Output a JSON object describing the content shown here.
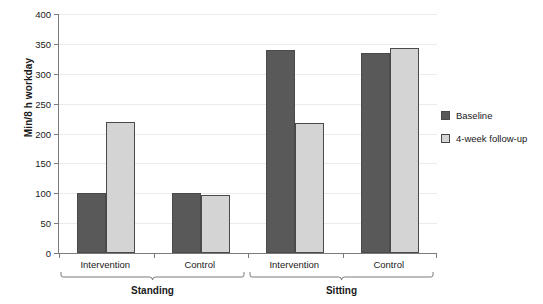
{
  "chart_data": {
    "type": "bar",
    "title": "",
    "xlabel": "",
    "ylabel": "Min/8 h workday",
    "ylim": [
      0,
      400
    ],
    "ytick_step": 50,
    "yticks": [
      400,
      350,
      300,
      250,
      200,
      150,
      100,
      50,
      0
    ],
    "grid": true,
    "legend_position": "right",
    "categories": [
      "Intervention",
      "Control",
      "Intervention",
      "Control"
    ],
    "supergroups": [
      {
        "label": "Standing",
        "categories": [
          "Intervention",
          "Control"
        ]
      },
      {
        "label": "Sitting",
        "categories": [
          "Intervention",
          "Control"
        ]
      }
    ],
    "series": [
      {
        "name": "Baseline",
        "color": "#595959",
        "values": [
          100,
          100,
          340,
          335
        ]
      },
      {
        "name": "4-week follow-up",
        "color": "#d4d4d4",
        "values": [
          220,
          97,
          218,
          343
        ]
      }
    ],
    "points": [
      {
        "supergroup": "Standing",
        "category": "Intervention",
        "series": "Baseline",
        "value": 100
      },
      {
        "supergroup": "Standing",
        "category": "Intervention",
        "series": "4-week follow-up",
        "value": 220
      },
      {
        "supergroup": "Standing",
        "category": "Control",
        "series": "Baseline",
        "value": 100
      },
      {
        "supergroup": "Standing",
        "category": "Control",
        "series": "4-week follow-up",
        "value": 97
      },
      {
        "supergroup": "Sitting",
        "category": "Intervention",
        "series": "Baseline",
        "value": 340
      },
      {
        "supergroup": "Sitting",
        "category": "Intervention",
        "series": "4-week follow-up",
        "value": 218
      },
      {
        "supergroup": "Sitting",
        "category": "Control",
        "series": "Baseline",
        "value": 335
      },
      {
        "supergroup": "Sitting",
        "category": "Control",
        "series": "4-week follow-up",
        "value": 343
      }
    ]
  },
  "axis": {
    "y_title": "Min/8 h workday",
    "tick_labels": [
      "400",
      "350",
      "300",
      "250",
      "200",
      "150",
      "100",
      "50",
      "0"
    ]
  },
  "categories": {
    "g0": "Intervention",
    "g1": "Control",
    "g2": "Intervention",
    "g3": "Control"
  },
  "supergroups": {
    "standing": "Standing",
    "sitting": "Sitting"
  },
  "legend": {
    "items": [
      {
        "label": "Baseline",
        "color": "#595959"
      },
      {
        "label": "4-week follow-up",
        "color": "#d4d4d4"
      }
    ]
  },
  "colors": {
    "baseline": "#595959",
    "followup": "#d4d4d4",
    "axis": "#7a7a7a",
    "grid": "#ebebeb",
    "background": "#ffffff",
    "text": "#1a1a1a"
  }
}
